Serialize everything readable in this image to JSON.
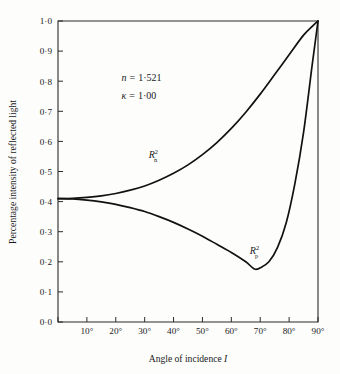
{
  "chart_data": {
    "type": "line",
    "title": "",
    "xlabel": "Angle of incidence I",
    "ylabel": "Percentage intensity of reflected light",
    "xlim": [
      0,
      90
    ],
    "ylim": [
      0.0,
      1.0
    ],
    "grid": false,
    "legend_position": "inline-curve-labels",
    "xticks": [
      0,
      10,
      20,
      30,
      40,
      50,
      60,
      70,
      80,
      90
    ],
    "xtick_labels": [
      "",
      "10°",
      "20°",
      "30°",
      "40°",
      "50°",
      "60°",
      "70°",
      "80°",
      "90°"
    ],
    "yticks": [
      0.0,
      0.1,
      0.2,
      0.3,
      0.4,
      0.5,
      0.6,
      0.7,
      0.8,
      0.9,
      1.0
    ],
    "ytick_labels": [
      "0·0",
      "0·1",
      "0·2",
      "0·3",
      "0·4",
      "0·5",
      "0·6",
      "0·7",
      "0·8",
      "0·9",
      "1·0"
    ],
    "annotations": [
      {
        "name": "refractive-index",
        "symbol": "n",
        "operator": "=",
        "value": "1·521",
        "x": 22,
        "y": 0.8
      },
      {
        "name": "extinction-coefficient",
        "symbol": "κ",
        "operator": "=",
        "value": "1·00",
        "x": 22,
        "y": 0.74
      }
    ],
    "series": [
      {
        "name": "R_n^2",
        "label_base": "R",
        "label_sub": "n",
        "label_sup": "2",
        "label_x": 33,
        "label_y": 0.545,
        "x": [
          0,
          5,
          10,
          15,
          20,
          25,
          30,
          35,
          40,
          45,
          50,
          55,
          60,
          65,
          70,
          75,
          80,
          85,
          88,
          90
        ],
        "y": [
          0.41,
          0.411,
          0.414,
          0.419,
          0.427,
          0.438,
          0.452,
          0.471,
          0.494,
          0.522,
          0.556,
          0.596,
          0.643,
          0.697,
          0.757,
          0.822,
          0.888,
          0.953,
          0.982,
          1.0
        ]
      },
      {
        "name": "R_p^2",
        "label_base": "R",
        "label_sub": "p",
        "label_sup": "2",
        "label_x": 68,
        "label_y": 0.225,
        "x": [
          0,
          5,
          10,
          15,
          20,
          25,
          30,
          35,
          40,
          45,
          50,
          55,
          60,
          65,
          68,
          70,
          73,
          76,
          79,
          82,
          85,
          88,
          90
        ],
        "y": [
          0.41,
          0.409,
          0.405,
          0.399,
          0.391,
          0.38,
          0.367,
          0.35,
          0.331,
          0.309,
          0.285,
          0.258,
          0.231,
          0.2,
          0.176,
          0.18,
          0.2,
          0.248,
          0.33,
          0.46,
          0.63,
          0.855,
          1.0
        ]
      }
    ]
  },
  "geometry": {
    "plot_left": 58,
    "plot_right": 318,
    "plot_top": 21,
    "plot_bottom": 322,
    "tick_length": 5
  }
}
